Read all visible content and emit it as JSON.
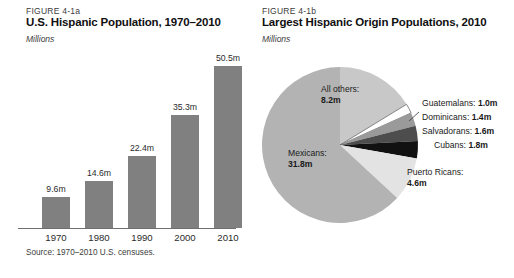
{
  "figure_a": {
    "number": "FIGURE 4-1a",
    "title": "U.S. Hispanic Population, 1970–2010",
    "units": "Millions",
    "source": "Source: 1970–2010 U.S. censuses."
  },
  "figure_b": {
    "number": "FIGURE 4-1b",
    "title": "Largest Hispanic Origin Populations, 2010",
    "units": "Millions"
  },
  "colors": {
    "bar_fill": "#808080",
    "axis": "#6f6f6f",
    "mexicans": "#b3b3b3",
    "all_others": "#c8c8c8",
    "guatemalans": "#ffffff",
    "dominicans": "#9a9a9a",
    "salvadorans": "#4d4d4d",
    "cubans": "#111111",
    "puerto_ricans": "#e3e3e3",
    "slice_stroke": "#555555"
  },
  "chart_data": [
    {
      "type": "bar",
      "title": "U.S. Hispanic Population, 1970–2010",
      "subtitle": "Millions",
      "xlabel": "",
      "ylabel": "Millions",
      "ylim": [
        0,
        55
      ],
      "grid": false,
      "legend": "none",
      "categories": [
        "1970",
        "1980",
        "1990",
        "2000",
        "2010"
      ],
      "values": [
        9.6,
        14.6,
        22.4,
        35.3,
        50.5
      ],
      "value_labels": [
        "9.6m",
        "14.6m",
        "22.4m",
        "35.3m",
        "50.5m"
      ],
      "source": "Source: 1970–2010 U.S. censuses."
    },
    {
      "type": "pie",
      "title": "Largest Hispanic Origin Populations, 2010",
      "subtitle": "Millions",
      "legend": "callout-labels",
      "labels": [
        "Mexicans",
        "Puerto Ricans",
        "Cubans",
        "Salvadorans",
        "Dominicans",
        "Guatemalans",
        "All others"
      ],
      "values": [
        31.8,
        4.6,
        1.8,
        1.6,
        1.4,
        1.0,
        8.2
      ],
      "slices": [
        {
          "name": "Mexicans",
          "value": 31.8,
          "label_lead": "Mexicans:",
          "label_value": "31.8m"
        },
        {
          "name": "Puerto Ricans",
          "value": 4.6,
          "label_lead": "Puerto Ricans:",
          "label_value": "4.6m"
        },
        {
          "name": "Cubans",
          "value": 1.8,
          "label_lead": "Cubans:",
          "label_value": "1.8m"
        },
        {
          "name": "Salvadorans",
          "value": 1.6,
          "label_lead": "Salvadorans:",
          "label_value": "1.6m"
        },
        {
          "name": "Dominicans",
          "value": 1.4,
          "label_lead": "Dominicans:",
          "label_value": "1.4m"
        },
        {
          "name": "Guatemalans",
          "value": 1.0,
          "label_lead": "Guatemalans:",
          "label_value": "1.0m"
        },
        {
          "name": "All others",
          "value": 8.2,
          "label_lead": "All others:",
          "label_value": "8.2m"
        }
      ]
    }
  ]
}
